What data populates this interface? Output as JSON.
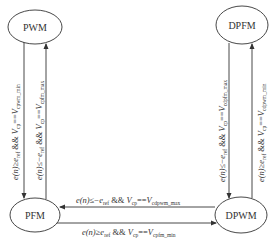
{
  "diagram": {
    "type": "state-machine",
    "nodes": [
      {
        "id": "pwm",
        "label": "PWM"
      },
      {
        "id": "dpfm",
        "label": "DPFM"
      },
      {
        "id": "pfm",
        "label": "PFM"
      },
      {
        "id": "dpwm",
        "label": "DPWM"
      }
    ],
    "edges": [
      {
        "id": "pwm-to-pfm",
        "from": "PWM",
        "to": "PFM",
        "cond_a": "e(n)",
        "op_a": "≥",
        "ref": "e",
        "ref_sub": "ref",
        "join": "&&",
        "v": "V",
        "v_sub": "cp",
        "eq": "==",
        "v2": "V",
        "v2_sub": "cpwm_min"
      },
      {
        "id": "pfm-to-pwm",
        "from": "PFM",
        "to": "PWM",
        "cond_a": "e(n)",
        "op_a": "≤−",
        "ref": "e",
        "ref_sub": "ref",
        "join": "&&",
        "v": "V",
        "v_sub": "cp",
        "eq": "==",
        "v2": "V",
        "v2_sub": "cpfm_max"
      },
      {
        "id": "dpfm-to-dpwm",
        "from": "DPFM",
        "to": "DPWM",
        "cond_a": "e(n)",
        "op_a": "≤−",
        "ref": "e",
        "ref_sub": "ref",
        "join": "&&",
        "v": "V",
        "v_sub": "cp",
        "eq": "==",
        "v2": "V",
        "v2_sub": "cdpfm_max"
      },
      {
        "id": "dpwm-to-dpfm",
        "from": "DPWM",
        "to": "DPFM",
        "cond_a": "e(n)",
        "op_a": "≥",
        "ref": "e",
        "ref_sub": "ref",
        "join": "&&",
        "v": "V",
        "v_sub": "cp",
        "eq": "==",
        "v2": "V",
        "v2_sub": "cdpwm_min"
      },
      {
        "id": "dpwm-to-pfm",
        "from": "DPWM",
        "to": "PFM",
        "cond_a": "e(n)",
        "op_a": "≤−",
        "ref": "e",
        "ref_sub": "ref",
        "join": "&&",
        "v": "V",
        "v_sub": "cp",
        "eq": "==",
        "v2": "V",
        "v2_sub": "cdpwm_max"
      },
      {
        "id": "pfm-to-dpwm",
        "from": "PFM",
        "to": "DPWM",
        "cond_a": "e(n)",
        "op_a": "≥",
        "ref": "e",
        "ref_sub": "ref",
        "join": "&&",
        "v": "V",
        "v_sub": "cp",
        "eq": "==",
        "v2": "V",
        "v2_sub": "cpfm_min"
      }
    ]
  }
}
